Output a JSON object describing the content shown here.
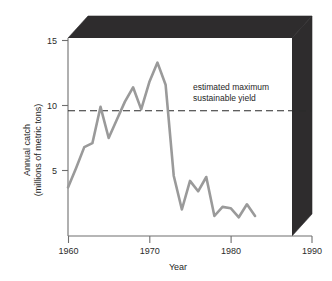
{
  "chart_data": {
    "type": "line",
    "title": "",
    "xlabel": "Year",
    "ylabel": "Annual catch (millions of metric tons)",
    "ylabel_line1": "Annual catch",
    "ylabel_line2": "(millions of metric tons)",
    "xlim": [
      1960,
      1990
    ],
    "ylim": [
      0,
      16.2
    ],
    "xticks": [
      1960,
      1970,
      1980,
      1990
    ],
    "xtick_labels": [
      "1960",
      "1970",
      "1980",
      "1990"
    ],
    "yticks": [
      5,
      10,
      15
    ],
    "ytick_labels": [
      "5",
      "10",
      "15"
    ],
    "grid": false,
    "legend": null,
    "series": [
      {
        "name": "annual catch",
        "color": "#9a9a9a",
        "x": [
          1960,
          1961,
          1962,
          1963,
          1964,
          1965,
          1966,
          1967,
          1968,
          1969,
          1970,
          1971,
          1972,
          1973,
          1974,
          1975,
          1976,
          1977,
          1978,
          1979,
          1980,
          1981,
          1982,
          1983
        ],
        "values": [
          3.7,
          5.2,
          6.8,
          7.1,
          9.9,
          7.5,
          8.9,
          10.3,
          11.4,
          9.7,
          11.8,
          13.3,
          11.6,
          4.6,
          2.0,
          4.2,
          3.4,
          4.5,
          1.5,
          2.2,
          2.1,
          1.4,
          2.4,
          1.5
        ]
      }
    ],
    "reference_line": {
      "label_line1": "estimated maximum",
      "label_line2": "sustainable yield",
      "value": 9.6,
      "style": "dashed",
      "color": "#2b2b2b"
    },
    "frame": {
      "style": "3d-box",
      "face_color": "#2e2c2d",
      "plot_background": "#ffffff",
      "axis_color": "#6f6f6f"
    }
  }
}
